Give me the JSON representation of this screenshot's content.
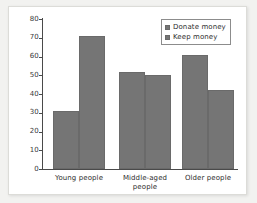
{
  "chart_data": {
    "type": "bar",
    "title": "",
    "xlabel": "",
    "ylabel": "",
    "categories": [
      "Young people",
      "Middle-aged people",
      "Older people"
    ],
    "category_lines": [
      [
        "Young people"
      ],
      [
        "Middle-aged",
        "people"
      ],
      [
        "Older people"
      ]
    ],
    "series": [
      {
        "name": "Donate money",
        "values": [
          31,
          52,
          61
        ]
      },
      {
        "name": "Keep money",
        "values": [
          71,
          50,
          42
        ]
      }
    ],
    "ylim": [
      0,
      80
    ],
    "yticks": [
      0,
      10,
      20,
      30,
      40,
      50,
      60,
      70,
      80
    ],
    "ytick_labels": [
      "0",
      "10",
      "20",
      "30",
      "40",
      "50",
      "60",
      "70",
      "80"
    ],
    "grid": false,
    "legend_position": "top-right",
    "legend_entries": [
      "Donate money",
      "Keep money"
    ],
    "colors": {
      "bar_fill": "#757575",
      "bar_edge": "#6a6a6a",
      "axis": "#4a4a4a",
      "text": "#2e2e2e",
      "plot_background": "#ffffff",
      "page_background": "#f2f2f0",
      "card_border": "#dcdcd8",
      "legend_border": "#8c8c8c"
    }
  }
}
